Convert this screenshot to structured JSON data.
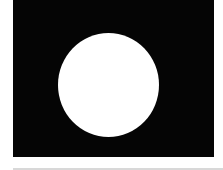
{
  "image": {
    "background_color": "#050505",
    "shape": "circle",
    "shape_color": "#ffffff",
    "page_color": "#ffffff",
    "rule_color": "#d8d8d8"
  }
}
